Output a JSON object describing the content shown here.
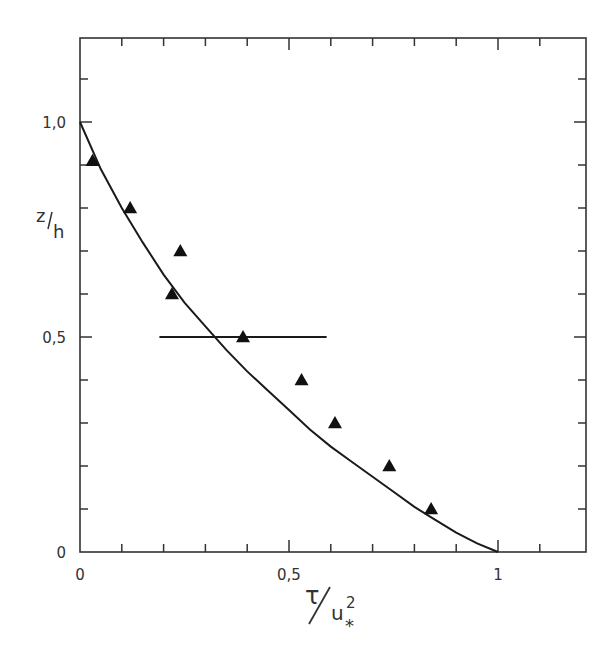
{
  "chart_data": {
    "type": "scatter",
    "title": "",
    "xlabel": "τ/u*²",
    "ylabel": "z/h",
    "xlim": [
      0,
      1.2
    ],
    "ylim": [
      0,
      1.2
    ],
    "grid": false,
    "legend": null,
    "x_ticks": [
      0,
      0.1,
      0.2,
      0.3,
      0.4,
      0.5,
      0.6,
      0.7,
      0.8,
      0.9,
      1.0,
      1.1
    ],
    "y_ticks": [
      0,
      0.1,
      0.2,
      0.3,
      0.4,
      0.5,
      0.6,
      0.7,
      0.8,
      0.9,
      1.0,
      1.1
    ],
    "x_tick_labels": [
      {
        "value": 0,
        "label": "0"
      },
      {
        "value": 0.5,
        "label": "0,5"
      },
      {
        "value": 1,
        "label": "1"
      }
    ],
    "y_tick_labels": [
      {
        "value": 0,
        "label": "0"
      },
      {
        "value": 0.5,
        "label": "0,5"
      },
      {
        "value": 1.0,
        "label": "1,0"
      }
    ],
    "series": [
      {
        "name": "measured",
        "type": "scatter",
        "marker": "filled-triangle",
        "points": [
          {
            "x": 0.03,
            "y": 0.91
          },
          {
            "x": 0.12,
            "y": 0.8
          },
          {
            "x": 0.24,
            "y": 0.7
          },
          {
            "x": 0.22,
            "y": 0.6
          },
          {
            "x": 0.39,
            "y": 0.5
          },
          {
            "x": 0.53,
            "y": 0.4
          },
          {
            "x": 0.61,
            "y": 0.3
          },
          {
            "x": 0.74,
            "y": 0.2
          },
          {
            "x": 0.84,
            "y": 0.1
          }
        ]
      },
      {
        "name": "theory",
        "type": "line",
        "points": [
          {
            "x": 0.0,
            "y": 1.0
          },
          {
            "x": 0.05,
            "y": 0.89
          },
          {
            "x": 0.1,
            "y": 0.8
          },
          {
            "x": 0.15,
            "y": 0.72
          },
          {
            "x": 0.2,
            "y": 0.645
          },
          {
            "x": 0.25,
            "y": 0.58
          },
          {
            "x": 0.3,
            "y": 0.525
          },
          {
            "x": 0.35,
            "y": 0.47
          },
          {
            "x": 0.4,
            "y": 0.42
          },
          {
            "x": 0.45,
            "y": 0.375
          },
          {
            "x": 0.5,
            "y": 0.33
          },
          {
            "x": 0.55,
            "y": 0.285
          },
          {
            "x": 0.6,
            "y": 0.245
          },
          {
            "x": 0.65,
            "y": 0.21
          },
          {
            "x": 0.7,
            "y": 0.175
          },
          {
            "x": 0.75,
            "y": 0.14
          },
          {
            "x": 0.8,
            "y": 0.105
          },
          {
            "x": 0.85,
            "y": 0.075
          },
          {
            "x": 0.9,
            "y": 0.045
          },
          {
            "x": 0.95,
            "y": 0.02
          },
          {
            "x": 1.0,
            "y": 0.0
          }
        ]
      }
    ],
    "annotations": [
      {
        "type": "error-bar-horizontal",
        "y": 0.5,
        "x_start": 0.19,
        "x_end": 0.59
      }
    ]
  },
  "labels": {
    "y_axis_num": "z",
    "y_axis_den": "h",
    "x_axis_num": "τ",
    "x_axis_den": "u",
    "x_axis_sup": "2",
    "x_axis_sub": "*"
  }
}
